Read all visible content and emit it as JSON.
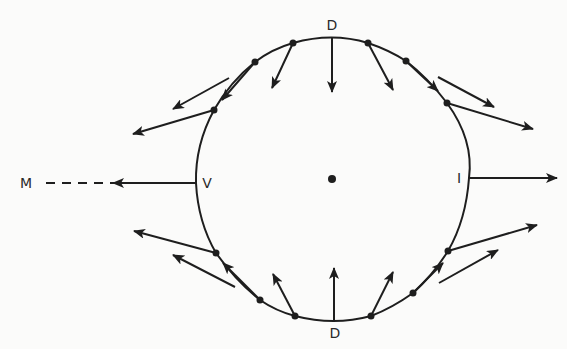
{
  "diagram": {
    "colors": {
      "ink": "#1e1e1e",
      "background": "#fbfbfa"
    },
    "labels": {
      "top": "D",
      "bottom": "D",
      "left": "V",
      "right": "I",
      "far_left": "M"
    },
    "center_dot": {
      "x": 332,
      "y": 179,
      "r": 4
    },
    "boundary_points": [
      {
        "x": 214,
        "y": 110
      },
      {
        "x": 255,
        "y": 62
      },
      {
        "x": 293,
        "y": 43
      },
      {
        "x": 368,
        "y": 43
      },
      {
        "x": 406,
        "y": 61
      },
      {
        "x": 447,
        "y": 103
      },
      {
        "x": 448,
        "y": 251
      },
      {
        "x": 413,
        "y": 293
      },
      {
        "x": 371,
        "y": 316
      },
      {
        "x": 295,
        "y": 316
      },
      {
        "x": 260,
        "y": 300
      },
      {
        "x": 216,
        "y": 253
      }
    ],
    "arrows": [
      {
        "id": "top-d",
        "x1": 332,
        "y1": 38,
        "x2": 332,
        "y2": 92
      },
      {
        "id": "top-l1",
        "x1": 293,
        "y1": 43,
        "x2": 272,
        "y2": 88
      },
      {
        "id": "top-l2",
        "x1": 255,
        "y1": 62,
        "x2": 222,
        "y2": 100
      },
      {
        "id": "top-l-free",
        "x1": 229,
        "y1": 78,
        "x2": 173,
        "y2": 109
      },
      {
        "id": "left-upper",
        "x1": 214,
        "y1": 110,
        "x2": 133,
        "y2": 134
      },
      {
        "id": "left-v",
        "x1": 196,
        "y1": 183,
        "x2": 113,
        "y2": 183
      },
      {
        "id": "left-lower",
        "x1": 216,
        "y1": 253,
        "x2": 134,
        "y2": 231
      },
      {
        "id": "bot-l-free",
        "x1": 235,
        "y1": 287,
        "x2": 173,
        "y2": 255
      },
      {
        "id": "bot-l2",
        "x1": 260,
        "y1": 300,
        "x2": 223,
        "y2": 263
      },
      {
        "id": "bot-l1",
        "x1": 295,
        "y1": 316,
        "x2": 273,
        "y2": 274
      },
      {
        "id": "bot-d",
        "x1": 334,
        "y1": 320,
        "x2": 334,
        "y2": 268
      },
      {
        "id": "bot-r1",
        "x1": 371,
        "y1": 316,
        "x2": 393,
        "y2": 272
      },
      {
        "id": "bot-r2",
        "x1": 413,
        "y1": 293,
        "x2": 443,
        "y2": 263
      },
      {
        "id": "bot-r-free",
        "x1": 439,
        "y1": 283,
        "x2": 498,
        "y2": 250
      },
      {
        "id": "right-lower",
        "x1": 448,
        "y1": 251,
        "x2": 537,
        "y2": 225
      },
      {
        "id": "right-i",
        "x1": 469,
        "y1": 178,
        "x2": 557,
        "y2": 178
      },
      {
        "id": "right-upper",
        "x1": 447,
        "y1": 103,
        "x2": 533,
        "y2": 129
      },
      {
        "id": "top-r-free",
        "x1": 438,
        "y1": 77,
        "x2": 494,
        "y2": 107
      },
      {
        "id": "top-r2",
        "x1": 406,
        "y1": 61,
        "x2": 438,
        "y2": 91
      },
      {
        "id": "top-r1",
        "x1": 368,
        "y1": 43,
        "x2": 393,
        "y2": 90
      }
    ],
    "dashed_line": {
      "x1": 46,
      "y1": 183,
      "x2": 113,
      "y2": 183
    }
  }
}
